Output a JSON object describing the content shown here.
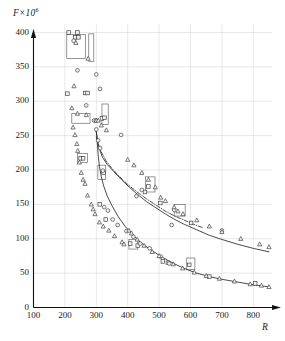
{
  "chart_data": {
    "type": "scatter",
    "title": "",
    "xlabel": "R",
    "ylabel": "F×10⁶",
    "ylabel_base": "F×10",
    "ylabel_exponent": "6",
    "xlim": [
      100,
      860
    ],
    "ylim": [
      0,
      412
    ],
    "grid": true,
    "legend": "none",
    "xticks": [
      100,
      200,
      300,
      400,
      500,
      600,
      700,
      800
    ],
    "yticks": [
      0,
      50,
      100,
      150,
      200,
      250,
      300,
      350,
      400
    ],
    "xtick_labels": [
      "100",
      "200",
      "300",
      "400",
      "500",
      "600",
      "700",
      "800"
    ],
    "ytick_labels": [
      "0",
      "50",
      "100",
      "150",
      "200",
      "250",
      "300",
      "350",
      "400"
    ],
    "series": [
      {
        "name": "upper-fit-curve",
        "style": "solid",
        "type": "line",
        "points": [
          [
            298,
            259
          ],
          [
            302,
            250
          ],
          [
            306,
            238
          ],
          [
            312,
            228
          ],
          [
            320,
            218
          ],
          [
            335,
            208
          ],
          [
            355,
            198
          ],
          [
            380,
            186
          ],
          [
            405,
            175
          ],
          [
            430,
            165
          ],
          [
            460,
            154
          ],
          [
            490,
            145
          ],
          [
            520,
            136
          ],
          [
            550,
            128
          ],
          [
            580,
            121
          ],
          [
            620,
            113
          ],
          [
            660,
            105
          ],
          [
            700,
            99
          ],
          [
            750,
            92
          ],
          [
            800,
            86
          ],
          [
            850,
            81
          ]
        ]
      },
      {
        "name": "upper-fit-curve-dashdot",
        "style": "dash-dot",
        "type": "line",
        "points": [
          [
            300,
            248
          ],
          [
            306,
            238
          ],
          [
            315,
            227
          ],
          [
            330,
            214
          ],
          [
            350,
            202
          ],
          [
            375,
            190
          ],
          [
            400,
            179
          ],
          [
            430,
            168
          ],
          [
            460,
            158
          ],
          [
            490,
            149
          ],
          [
            520,
            140
          ],
          [
            550,
            133
          ],
          [
            580,
            127
          ],
          [
            610,
            121
          ],
          [
            640,
            116
          ]
        ]
      },
      {
        "name": "lower-fit-curve",
        "style": "solid",
        "type": "line",
        "points": [
          [
            300,
            258
          ],
          [
            303,
            240
          ],
          [
            306,
            222
          ],
          [
            310,
            205
          ],
          [
            316,
            190
          ],
          [
            324,
            176
          ],
          [
            335,
            162
          ],
          [
            350,
            148
          ],
          [
            370,
            132
          ],
          [
            392,
            118
          ],
          [
            415,
            106
          ],
          [
            440,
            95
          ],
          [
            470,
            85
          ],
          [
            500,
            76
          ],
          [
            530,
            68
          ],
          [
            560,
            61
          ],
          [
            590,
            55
          ],
          [
            620,
            50
          ],
          [
            660,
            45
          ],
          [
            700,
            41
          ],
          [
            750,
            37
          ],
          [
            800,
            33
          ],
          [
            850,
            30
          ]
        ]
      },
      {
        "name": "squares",
        "marker": "square",
        "points": [
          [
            212,
            400
          ],
          [
            240,
            400
          ],
          [
            233,
            393
          ],
          [
            243,
            393
          ],
          [
            208,
            311
          ],
          [
            265,
            312
          ],
          [
            272,
            312
          ],
          [
            250,
            217
          ],
          [
            258,
            217
          ],
          [
            323,
            196
          ],
          [
            318,
            275
          ],
          [
            326,
            276
          ],
          [
            466,
            176
          ],
          [
            602,
            123
          ],
          [
            596,
            62
          ],
          [
            660,
            45
          ],
          [
            806,
            35
          ],
          [
            311,
            150
          ],
          [
            330,
            128
          ],
          [
            408,
            93
          ],
          [
            432,
            90
          ],
          [
            512,
            67
          ],
          [
            528,
            65
          ],
          [
            455,
            168
          ],
          [
            504,
            152
          ]
        ]
      },
      {
        "name": "circles",
        "marker": "circle",
        "points": [
          [
            228,
            388
          ],
          [
            240,
            345
          ],
          [
            300,
            339
          ],
          [
            312,
            318
          ],
          [
            268,
            294
          ],
          [
            300,
            259
          ],
          [
            293,
            272
          ],
          [
            299,
            272
          ],
          [
            379,
            251
          ],
          [
            321,
            199
          ],
          [
            428,
            162
          ],
          [
            445,
            171
          ],
          [
            540,
            120
          ],
          [
            548,
            142
          ],
          [
            700,
            112
          ],
          [
            306,
            243
          ],
          [
            312,
            232
          ],
          [
            325,
            146
          ],
          [
            337,
            141
          ],
          [
            396,
            111
          ],
          [
            418,
            103
          ],
          [
            440,
            93
          ],
          [
            470,
            86
          ],
          [
            505,
            74
          ],
          [
            532,
            64
          ],
          [
            352,
            128
          ],
          [
            368,
            120
          ]
        ]
      },
      {
        "name": "triangles",
        "marker": "triangle",
        "points": [
          [
            235,
            385
          ],
          [
            274,
            362
          ],
          [
            229,
            322
          ],
          [
            222,
            290
          ],
          [
            240,
            282
          ],
          [
            268,
            280
          ],
          [
            226,
            262
          ],
          [
            232,
            251
          ],
          [
            238,
            238
          ],
          [
            241,
            228
          ],
          [
            246,
            211
          ],
          [
            252,
            196
          ],
          [
            258,
            186
          ],
          [
            264,
            180
          ],
          [
            272,
            163
          ],
          [
            284,
            150
          ],
          [
            290,
            143
          ],
          [
            296,
            136
          ],
          [
            300,
            272
          ],
          [
            306,
            272
          ],
          [
            316,
            265
          ],
          [
            332,
            258
          ],
          [
            400,
            215
          ],
          [
            420,
            207
          ],
          [
            445,
            196
          ],
          [
            466,
            186
          ],
          [
            488,
            175
          ],
          [
            505,
            160
          ],
          [
            520,
            155
          ],
          [
            548,
            146
          ],
          [
            560,
            140
          ],
          [
            576,
            136
          ],
          [
            620,
            127
          ],
          [
            660,
            118
          ],
          [
            700,
            110
          ],
          [
            760,
            100
          ],
          [
            820,
            92
          ],
          [
            850,
            88
          ],
          [
            310,
            124
          ],
          [
            322,
            118
          ],
          [
            340,
            112
          ],
          [
            358,
            104
          ],
          [
            382,
            95
          ],
          [
            404,
            112
          ],
          [
            412,
            108
          ],
          [
            430,
            99
          ],
          [
            452,
            90
          ],
          [
            478,
            81
          ],
          [
            500,
            75
          ],
          [
            545,
            63
          ],
          [
            575,
            57
          ],
          [
            612,
            51
          ],
          [
            650,
            46
          ],
          [
            692,
            42
          ],
          [
            740,
            38
          ],
          [
            790,
            34
          ],
          [
            826,
            32
          ],
          [
            850,
            30
          ],
          [
            388,
            92
          ]
        ]
      }
    ],
    "error_boxes": [
      {
        "x0": 206,
        "x1": 265,
        "y0": 362,
        "y1": 397
      },
      {
        "x0": 276,
        "x1": 292,
        "y0": 358,
        "y1": 398
      },
      {
        "x0": 222,
        "x1": 280,
        "y0": 268,
        "y1": 282
      },
      {
        "x0": 318,
        "x1": 338,
        "y0": 266,
        "y1": 296
      },
      {
        "x0": 240,
        "x1": 272,
        "y0": 211,
        "y1": 224
      },
      {
        "x0": 305,
        "x1": 330,
        "y0": 186,
        "y1": 207
      },
      {
        "x0": 457,
        "x1": 487,
        "y0": 168,
        "y1": 190
      },
      {
        "x0": 548,
        "x1": 583,
        "y0": 133,
        "y1": 150
      },
      {
        "x0": 404,
        "x1": 432,
        "y0": 85,
        "y1": 99
      },
      {
        "x0": 588,
        "x1": 614,
        "y0": 55,
        "y1": 72
      }
    ]
  }
}
